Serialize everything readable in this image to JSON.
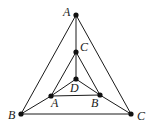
{
  "diagram": {
    "type": "planar-graph",
    "nodes": [
      {
        "id": "outerA",
        "label": "A"
      },
      {
        "id": "outerB",
        "label": "B"
      },
      {
        "id": "outerC",
        "label": "C"
      },
      {
        "id": "innerA",
        "label": "A"
      },
      {
        "id": "innerB",
        "label": "B"
      },
      {
        "id": "innerC",
        "label": "C"
      },
      {
        "id": "D",
        "label": "D"
      }
    ],
    "edges": [
      [
        "outerA",
        "outerB"
      ],
      [
        "outerA",
        "outerC"
      ],
      [
        "outerB",
        "outerC"
      ],
      [
        "outerA",
        "innerC"
      ],
      [
        "outerB",
        "innerA"
      ],
      [
        "outerC",
        "innerB"
      ],
      [
        "innerC",
        "innerA"
      ],
      [
        "innerC",
        "innerB"
      ],
      [
        "innerA",
        "innerB"
      ],
      [
        "innerC",
        "D"
      ],
      [
        "innerA",
        "D"
      ],
      [
        "innerB",
        "D"
      ]
    ]
  }
}
